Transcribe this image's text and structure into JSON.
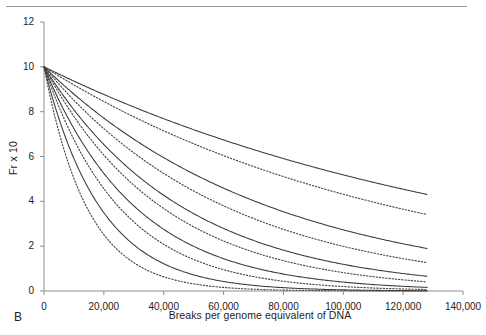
{
  "panel": {
    "label": "B"
  },
  "chart_data": {
    "type": "line",
    "title": "",
    "xlabel": "Breaks per genome equivalent of DNA",
    "ylabel": "Fr x 10",
    "xlim": [
      0,
      140000
    ],
    "ylim": [
      0,
      12
    ],
    "xticks": [
      0,
      20000,
      40000,
      60000,
      80000,
      100000,
      120000,
      140000
    ],
    "xticklabels": [
      "0",
      "20,000",
      "40,000",
      "60,000",
      "80,000",
      "100,000",
      "120,000",
      "140,000"
    ],
    "yticks": [
      0,
      2,
      4,
      6,
      8,
      10,
      12
    ],
    "yticklabels": [
      "0",
      "2",
      "4",
      "6",
      "8",
      "10",
      "12"
    ],
    "grid": false,
    "legend": false,
    "x_sample": [
      0,
      2500,
      5000,
      7500,
      10000,
      12500,
      15000,
      17500,
      20000,
      25000,
      30000,
      35000,
      40000,
      45000,
      50000,
      55000,
      60000,
      65000,
      70000,
      75000,
      80000,
      85000,
      90000,
      95000,
      100000,
      105000,
      110000,
      115000,
      120000,
      125000,
      128000
    ],
    "series": [
      {
        "name": "curve-1-fit",
        "style": "solid",
        "color": "#3a3a3a",
        "y0": 10.0,
        "decay_constant": 152000,
        "values": [
          10.0,
          8.41,
          7.08,
          5.95,
          5.01,
          4.21,
          3.54,
          2.98,
          2.51,
          1.77,
          1.25,
          0.89,
          0.63,
          0.44,
          0.31,
          0.22,
          0.16,
          0.11,
          0.08,
          0.06,
          0.04,
          0.03,
          0.02,
          0.01,
          0.01,
          0.01,
          0.01,
          0.0,
          0.0,
          0.0,
          0.0
        ]
      },
      {
        "name": "curve-1-bound",
        "style": "dotted",
        "color": "#4a4a4a",
        "y0": 10.0,
        "decay_constant": 119000,
        "values": [
          10.0,
          8.09,
          6.55,
          5.3,
          4.29,
          3.47,
          2.81,
          2.27,
          1.84,
          1.2,
          0.79,
          0.52,
          0.34,
          0.22,
          0.15,
          0.09,
          0.06,
          0.04,
          0.03,
          0.02,
          0.01,
          0.01,
          0.0,
          0.0,
          0.0,
          0.0,
          0.0,
          0.0,
          0.0,
          0.0,
          0.0
        ]
      },
      {
        "name": "curve-2-fit",
        "style": "solid",
        "color": "#3a3a3a",
        "y0": 10.0,
        "decay_constant": 77000,
        "values": [
          10.0,
          8.87,
          7.87,
          6.98,
          6.19,
          5.49,
          4.87,
          4.32,
          3.83,
          3.02,
          2.37,
          1.87,
          1.47,
          1.16,
          0.91,
          0.72,
          0.56,
          0.44,
          0.35,
          0.28,
          0.22,
          0.17,
          0.13,
          0.11,
          0.08,
          0.07,
          0.05,
          0.04,
          0.03,
          0.03,
          0.02
        ]
      },
      {
        "name": "curve-2-bound",
        "style": "dotted",
        "color": "#4a4a4a",
        "y0": 10.0,
        "decay_constant": 62000,
        "values": [
          10.0,
          8.63,
          7.45,
          6.43,
          5.55,
          4.79,
          4.13,
          3.57,
          3.08,
          2.29,
          1.71,
          1.27,
          0.95,
          0.71,
          0.53,
          0.39,
          0.29,
          0.22,
          0.16,
          0.12,
          0.09,
          0.07,
          0.05,
          0.04,
          0.03,
          0.02,
          0.02,
          0.01,
          0.01,
          0.01,
          0.01
        ]
      },
      {
        "name": "curve-3-fit",
        "style": "solid",
        "color": "#3a3a3a",
        "y0": 10.0,
        "decay_constant": 47000,
        "values": [
          10.0,
          9.48,
          8.98,
          8.51,
          8.07,
          7.65,
          7.25,
          6.87,
          6.51,
          5.85,
          5.25,
          4.72,
          4.24,
          3.81,
          3.42,
          3.08,
          2.76,
          2.48,
          2.23,
          2.01,
          1.8,
          1.62,
          1.45,
          1.31,
          1.17,
          1.05,
          0.95,
          0.85,
          0.76,
          0.69,
          0.65
        ]
      },
      {
        "name": "curve-3-bound",
        "style": "dotted",
        "color": "#4a4a4a",
        "y0": 10.0,
        "decay_constant": 40000,
        "values": [
          10.0,
          9.39,
          8.82,
          8.29,
          7.79,
          7.32,
          6.88,
          6.46,
          6.07,
          5.36,
          4.72,
          4.17,
          3.68,
          3.25,
          2.87,
          2.53,
          2.23,
          1.97,
          1.74,
          1.53,
          1.35,
          1.19,
          1.05,
          0.93,
          0.82,
          0.72,
          0.64,
          0.56,
          0.5,
          0.44,
          0.41
        ]
      },
      {
        "name": "curve-4-fit",
        "style": "solid",
        "color": "#3a3a3a",
        "y0": 10.0,
        "decay_constant": 31000,
        "values": [
          10.0,
          9.23,
          8.52,
          7.86,
          7.25,
          6.69,
          6.18,
          5.7,
          5.26,
          4.48,
          3.82,
          3.25,
          2.77,
          2.36,
          2.01,
          1.71,
          1.46,
          1.24,
          1.06,
          0.9,
          0.77,
          0.65,
          0.56,
          0.47,
          0.4,
          0.34,
          0.29,
          0.25,
          0.21,
          0.18,
          0.17
        ]
      },
      {
        "name": "curve-4-bound",
        "style": "dotted",
        "color": "#4a4a4a",
        "y0": 10.0,
        "decay_constant": 25500,
        "values": [
          10.0,
          9.07,
          8.22,
          7.46,
          6.76,
          6.13,
          5.56,
          5.04,
          4.57,
          3.75,
          3.08,
          2.53,
          2.08,
          1.71,
          1.4,
          1.15,
          0.95,
          0.78,
          0.64,
          0.52,
          0.43,
          0.35,
          0.29,
          0.24,
          0.2,
          0.16,
          0.13,
          0.11,
          0.09,
          0.07,
          0.07
        ]
      },
      {
        "name": "curve-5-fit",
        "style": "solid",
        "color": "#3a3a3a",
        "y0": 10.0,
        "decay_constant": 19000,
        "values": [
          10.0,
          8.77,
          7.69,
          6.74,
          5.91,
          5.18,
          4.55,
          3.99,
          3.5,
          2.69,
          2.07,
          1.59,
          1.22,
          0.94,
          0.72,
          0.55,
          0.43,
          0.33,
          0.25,
          0.19,
          0.15,
          0.11,
          0.09,
          0.07,
          0.05,
          0.04,
          0.03,
          0.02,
          0.02,
          0.01,
          0.01
        ]
      },
      {
        "name": "curve-5-bound",
        "style": "dotted",
        "color": "#4a4a4a",
        "y0": 10.0,
        "decay_constant": 14500,
        "values": [
          10.0,
          8.42,
          7.09,
          5.97,
          5.03,
          4.23,
          3.56,
          3.0,
          2.53,
          1.79,
          1.27,
          0.9,
          0.63,
          0.45,
          0.32,
          0.22,
          0.16,
          0.11,
          0.08,
          0.06,
          0.04,
          0.03,
          0.02,
          0.01,
          0.01,
          0.01,
          0.0,
          0.0,
          0.0,
          0.0,
          0.0
        ]
      }
    ]
  }
}
